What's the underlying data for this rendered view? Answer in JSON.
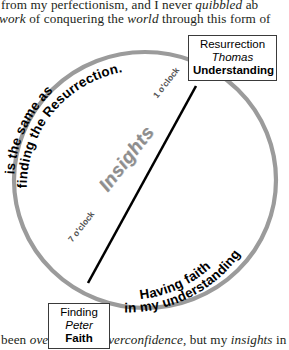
{
  "page": {
    "body_text": {
      "line1_pre": "from my perfectionism, and I never ",
      "line1_italic": "quibbled",
      "line1_post": " ab",
      "line2_italic_1": "work",
      "line2_mid": " of conquering the ",
      "line2_italic_2": "world",
      "line2_post": " through this form of",
      "line3_pre": "been ",
      "line3_italic_1": "overcome",
      "line3_mid_1": " by ",
      "line3_italic_2": "overconfidence",
      "line3_mid_2": ", but my ",
      "line3_italic_3": "insights",
      "line3_post": " in"
    }
  },
  "diagram": {
    "nodes": [
      {
        "id": "resurrection",
        "line_top": "Resurrection",
        "line_mid": "Thomas",
        "line_bot": "Understanding"
      },
      {
        "id": "finding",
        "line_top": "Finding",
        "line_mid": "Peter",
        "line_bot": "Faith"
      }
    ],
    "axis_label": "Insights",
    "clock_labels": {
      "upper": "1 o'clock",
      "lower": "7 o'clock"
    },
    "arc_text": {
      "upper_outer": "is the same as",
      "upper_inner": "finding the Resurrection.",
      "lower_outer": "Having faith",
      "lower_inner": "in my understanding"
    },
    "colors": {
      "ellipse_stroke": "#9b9b9b",
      "diagonal_stroke": "#000000",
      "insights_fill": "#8e8e8e",
      "box_border": "#3a3a3a",
      "text": "#000000"
    }
  }
}
